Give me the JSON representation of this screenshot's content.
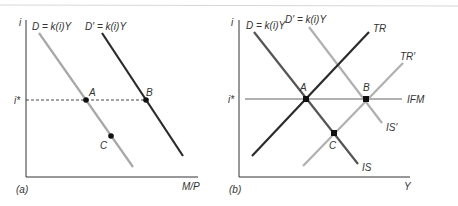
{
  "figure": {
    "panels": [
      {
        "id": "a",
        "caption": "(a)",
        "y_axis_label": "i",
        "x_axis_label": "M/P",
        "level_label": "i*",
        "curves": [
          {
            "label": "D = k(i)Y",
            "color": "#a8a8a8"
          },
          {
            "label": "D′ = k(i)Y",
            "color": "#2b2b2b"
          }
        ],
        "points": [
          {
            "label": "A"
          },
          {
            "label": "B"
          },
          {
            "label": "C"
          }
        ]
      },
      {
        "id": "b",
        "caption": "(b)",
        "y_axis_label": "i",
        "x_axis_label": "Y",
        "level_label": "i*",
        "curves": [
          {
            "label": "D = k(i)Y",
            "color": "#555555"
          },
          {
            "label": "D′ = k(i)Y",
            "color": "#b0b0b0"
          },
          {
            "label": "TR",
            "color": "#2b2b2b"
          },
          {
            "label": "TR′",
            "color": "#b0b0b0"
          },
          {
            "label": "IFM",
            "color": "#b0b0b0"
          },
          {
            "label": "IS",
            "color": "#555555"
          },
          {
            "label": "IS′",
            "color": "#b0b0b0"
          }
        ],
        "points": [
          {
            "label": "A"
          },
          {
            "label": "B"
          },
          {
            "label": "C"
          }
        ]
      }
    ]
  }
}
